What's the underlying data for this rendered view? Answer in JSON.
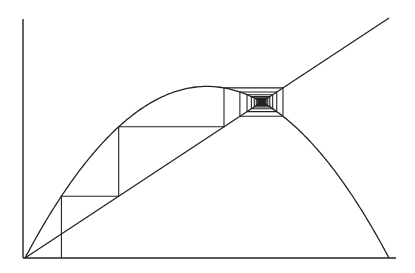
{
  "diagram": {
    "type": "cobweb-plot",
    "map": "x_{n+1} = r x_n (1 - x_n)",
    "r": 2.86,
    "x0": 0.1,
    "iterations": 60,
    "fixed_point": 0.65,
    "elements": [
      "x-axis",
      "y-axis",
      "parabola",
      "diagonal-line-y-equals-x",
      "cobweb-path"
    ],
    "labels": []
  },
  "layout": {
    "origin_px": [
      25,
      258
    ],
    "x_unit_px": 364,
    "y_unit_px": 240,
    "x_axis_end_px": 396,
    "y_axis_top_px": 19,
    "diagonal_end_x": 1.0
  },
  "colors": {
    "background": "#ffffff",
    "stroke": "#222222"
  }
}
